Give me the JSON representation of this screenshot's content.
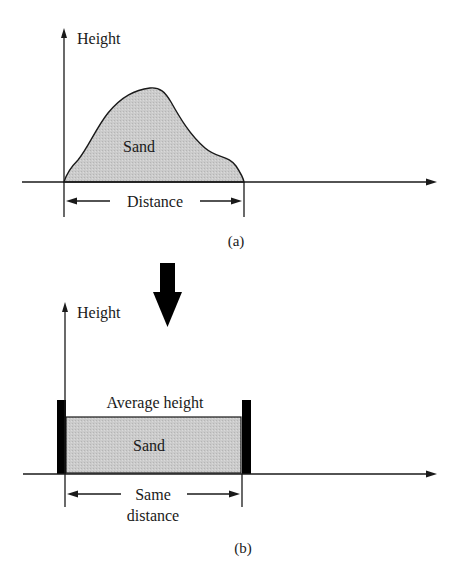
{
  "colors": {
    "line": "#1a1a1a",
    "sand_fill": "#c9c9c9",
    "post": "#000000",
    "background": "#ffffff"
  },
  "panel_a": {
    "y_axis_label": "Height",
    "region_label": "Sand",
    "dimension_label": "Distance",
    "caption": "(a)"
  },
  "transition_arrow": {
    "icon": "down-arrow-icon"
  },
  "panel_b": {
    "y_axis_label": "Height",
    "level_label": "Average height",
    "region_label": "Sand",
    "dimension_label_line1": "Same",
    "dimension_label_line2": "distance",
    "caption": "(b)"
  }
}
